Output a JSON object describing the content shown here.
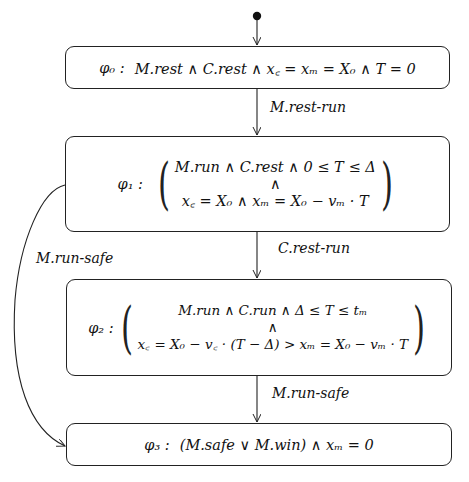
{
  "diagram": {
    "type": "state-transition-diagram",
    "states": [
      {
        "id": "phi0",
        "label": "φ₀ :",
        "formula": "M.rest ∧ C.rest ∧ x꜀ = xₘ = X₀ ∧ T = 0"
      },
      {
        "id": "phi1",
        "label": "φ₁ :",
        "line1": "M.run ∧ C.rest ∧ 0 ≤ T ≤ Δ",
        "conj": "∧",
        "line2": "x꜀ = X₀ ∧ xₘ = X₀ − vₘ · T"
      },
      {
        "id": "phi2",
        "label": "φ₂ :",
        "line1": "M.run ∧ C.run ∧ Δ ≤ T ≤ tₘ",
        "conj": "∧",
        "line2": "x꜀ = X₀ − v꜀ · (T − Δ) > xₘ = X₀ − vₘ · T"
      },
      {
        "id": "phi3",
        "label": "φ₃ :",
        "formula": "(M.safe ∨ M.win) ∧ xₘ = 0"
      }
    ],
    "transitions": [
      {
        "from": "initial",
        "to": "phi0",
        "label": ""
      },
      {
        "from": "phi0",
        "to": "phi1",
        "label": "M.rest-run"
      },
      {
        "from": "phi1",
        "to": "phi2",
        "label": "C.rest-run"
      },
      {
        "from": "phi2",
        "to": "phi3",
        "label": "M.run-safe"
      },
      {
        "from": "phi1",
        "to": "phi3",
        "label": "M.run-safe"
      }
    ]
  }
}
